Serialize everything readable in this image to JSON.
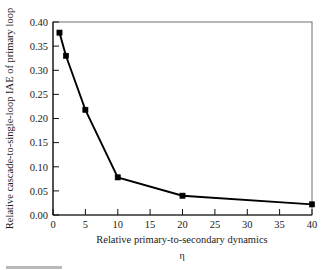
{
  "chart_data": {
    "type": "line",
    "title": "",
    "xlabel": "Relative primary-to-secondary dynamics",
    "xvar": "η",
    "ylabel": "Relative cascade-to-single-loop IAE of primary loop",
    "xlim": [
      0,
      40
    ],
    "ylim": [
      0.0,
      0.4
    ],
    "grid": false,
    "legend": false,
    "marker": "filled-square",
    "line_color": "#000000",
    "x": [
      1,
      2,
      5,
      10,
      20,
      40
    ],
    "values": [
      0.378,
      0.33,
      0.218,
      0.078,
      0.04,
      0.022
    ],
    "series": [
      {
        "name": "Relative cascade-to-single-loop IAE",
        "x": [
          1,
          2,
          5,
          10,
          20,
          40
        ],
        "values": [
          0.378,
          0.33,
          0.218,
          0.078,
          0.04,
          0.022
        ]
      }
    ],
    "xticks": [
      0,
      5,
      10,
      15,
      20,
      25,
      30,
      35,
      40
    ],
    "xticklabels": [
      "0",
      "5",
      "10",
      "15",
      "20",
      "25",
      "30",
      "35",
      "40"
    ],
    "yticks": [
      0.0,
      0.05,
      0.1,
      0.15,
      0.2,
      0.25,
      0.3,
      0.35,
      0.4
    ],
    "yticklabels": [
      "0.00",
      "0.05",
      "0.10",
      "0.15",
      "0.20",
      "0.25",
      "0.30",
      "0.35",
      "0.40"
    ]
  }
}
